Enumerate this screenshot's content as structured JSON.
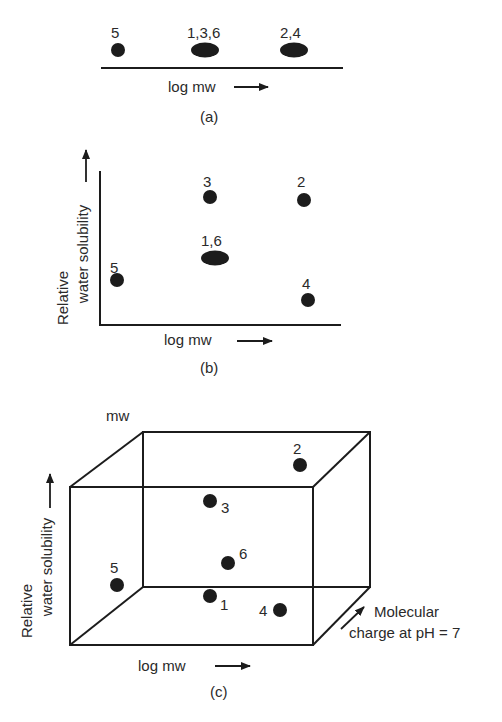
{
  "figure": {
    "panels": [
      {
        "id": "a",
        "caption": "(a)",
        "x_axis_label": "log mw",
        "points": [
          {
            "label": "5",
            "compounds": [
              5
            ]
          },
          {
            "label": "1,3,6",
            "compounds": [
              1,
              3,
              6
            ]
          },
          {
            "label": "2,4",
            "compounds": [
              2,
              4
            ]
          }
        ]
      },
      {
        "id": "b",
        "caption": "(b)",
        "x_axis_label": "log mw",
        "y_axis_label_line1": "Relative",
        "y_axis_label_line2": "water solubility",
        "points": [
          {
            "label": "5"
          },
          {
            "label": "3"
          },
          {
            "label": "1,6"
          },
          {
            "label": "2"
          },
          {
            "label": "4"
          }
        ]
      },
      {
        "id": "c",
        "caption": "(c)",
        "x_axis_label": "log mw",
        "y_axis_label_line1": "Relative",
        "y_axis_label_line2": "water solubility",
        "z_axis_label_line1": "Molecular",
        "z_axis_label_line2": "charge at pH = 7",
        "top_label": "mw",
        "points": [
          {
            "label": "2"
          },
          {
            "label": "3"
          },
          {
            "label": "6"
          },
          {
            "label": "5"
          },
          {
            "label": "1"
          },
          {
            "label": "4"
          }
        ]
      }
    ]
  },
  "colors": {
    "ink": "#1c1c1c",
    "background": "#ffffff"
  }
}
